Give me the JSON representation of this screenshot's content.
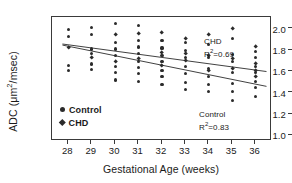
{
  "chart_data": {
    "type": "scatter",
    "title": "",
    "xlabel": "Gestational Age (weeks)",
    "ylabel_text": "ADC (μm",
    "ylabel_sup": "2",
    "ylabel_tail": "/msec)",
    "ylabel_plain": "ADC (μm2/msec)",
    "xlim": [
      27.3,
      36.7
    ],
    "ylim": [
      0.92,
      2.08
    ],
    "grid": false,
    "legend_position": "inside-bottom-left",
    "xticks": [
      28,
      29,
      30,
      31,
      32,
      33,
      34,
      35,
      36
    ],
    "xtick_labels": [
      "28",
      "29",
      "30",
      "31",
      "32",
      "33",
      "34",
      "35",
      "36"
    ],
    "yticks": [
      1.0,
      1.2,
      1.4,
      1.6,
      1.8,
      2.0
    ],
    "ytick_labels": [
      "1.0",
      "1.2",
      "1.4",
      "1.6",
      "1.8",
      "2.0"
    ],
    "legend": [
      {
        "label": "Control",
        "marker": "circle"
      },
      {
        "label": "CHD",
        "marker": "diamond"
      }
    ],
    "annotations": [
      {
        "name": "chd-fit",
        "series": "CHD",
        "label": "CHD",
        "r2_prefix": "R",
        "r2_sup": "2",
        "r2_value": "=0.69",
        "r2_plain": "R2=0.69"
      },
      {
        "name": "control-fit",
        "series": "Control",
        "label": "Control",
        "r2_prefix": "R",
        "r2_sup": "2",
        "r2_value": "=0.83",
        "r2_plain": "R2=0.83"
      }
    ],
    "trendlines": [
      {
        "name": "CHD",
        "x": [
          27.75,
          36.55
        ],
        "y": [
          1.825,
          1.565
        ]
      },
      {
        "name": "Control",
        "x": [
          27.75,
          36.55
        ],
        "y": [
          1.815,
          1.425
        ]
      }
    ],
    "series": [
      {
        "name": "Control",
        "marker": "circle",
        "points": [
          [
            28.0,
            1.96
          ],
          [
            28.0,
            1.9
          ],
          [
            28.0,
            1.63
          ],
          [
            28.0,
            1.58
          ],
          [
            29.0,
            1.98
          ],
          [
            29.0,
            1.92
          ],
          [
            29.0,
            1.78
          ],
          [
            29.0,
            1.74
          ],
          [
            29.0,
            1.64
          ],
          [
            29.0,
            1.59
          ],
          [
            30.0,
            2.02
          ],
          [
            30.0,
            1.84
          ],
          [
            30.0,
            1.78
          ],
          [
            30.0,
            1.72
          ],
          [
            30.0,
            1.62
          ],
          [
            30.0,
            1.56
          ],
          [
            30.0,
            1.49
          ],
          [
            31.0,
            2.0
          ],
          [
            31.0,
            1.86
          ],
          [
            31.0,
            1.8
          ],
          [
            31.0,
            1.74
          ],
          [
            31.0,
            1.66
          ],
          [
            31.0,
            1.61
          ],
          [
            31.0,
            1.55
          ],
          [
            31.0,
            1.48
          ],
          [
            32.0,
            1.86
          ],
          [
            32.0,
            1.79
          ],
          [
            32.0,
            1.72
          ],
          [
            32.0,
            1.66
          ],
          [
            32.0,
            1.58
          ],
          [
            32.0,
            1.52
          ],
          [
            32.0,
            1.45
          ],
          [
            33.0,
            1.84
          ],
          [
            33.0,
            1.77
          ],
          [
            33.0,
            1.7
          ],
          [
            33.0,
            1.62
          ],
          [
            33.0,
            1.55
          ],
          [
            33.0,
            1.47
          ],
          [
            33.0,
            1.4
          ],
          [
            34.0,
            1.82
          ],
          [
            34.0,
            1.7
          ],
          [
            34.0,
            1.6
          ],
          [
            34.0,
            1.52
          ],
          [
            34.0,
            1.45
          ],
          [
            34.0,
            1.38
          ],
          [
            35.0,
            1.88
          ],
          [
            35.0,
            1.73
          ],
          [
            35.0,
            1.66
          ],
          [
            35.0,
            1.56
          ],
          [
            35.0,
            1.46
          ],
          [
            35.0,
            1.38
          ],
          [
            35.0,
            1.3
          ],
          [
            36.0,
            1.76
          ],
          [
            36.0,
            1.7
          ],
          [
            36.0,
            1.62
          ],
          [
            36.0,
            1.56
          ],
          [
            36.0,
            1.48
          ],
          [
            36.0,
            1.42
          ],
          [
            36.0,
            1.34
          ]
        ]
      },
      {
        "name": "CHD",
        "marker": "diamond",
        "points": [
          [
            28.0,
            1.79
          ],
          [
            29.0,
            1.7
          ],
          [
            30.0,
            1.91
          ],
          [
            30.0,
            1.66
          ],
          [
            31.0,
            1.92
          ],
          [
            31.0,
            1.69
          ],
          [
            32.0,
            1.93
          ],
          [
            32.0,
            1.75
          ],
          [
            32.0,
            1.62
          ],
          [
            33.0,
            1.88
          ],
          [
            33.0,
            1.74
          ],
          [
            33.0,
            1.67
          ],
          [
            34.0,
            1.91
          ],
          [
            34.0,
            1.72
          ],
          [
            34.0,
            1.58
          ],
          [
            35.0,
            1.97
          ],
          [
            35.0,
            1.69
          ],
          [
            35.0,
            1.6
          ],
          [
            36.0,
            1.8
          ],
          [
            36.0,
            1.64
          ],
          [
            36.0,
            1.58
          ],
          [
            36.0,
            1.52
          ]
        ]
      }
    ]
  }
}
